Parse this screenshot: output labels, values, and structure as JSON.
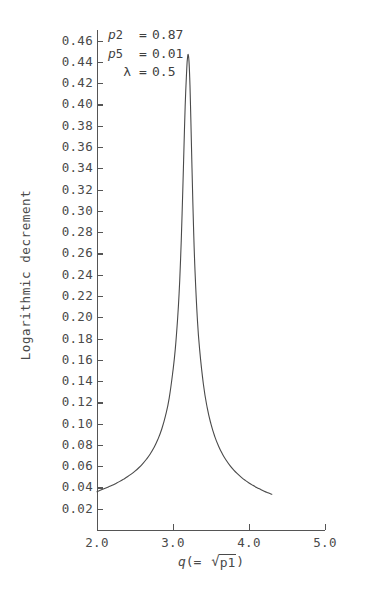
{
  "chart_data": {
    "type": "line",
    "title": "",
    "xlabel": "q(= √p1)",
    "ylabel": "Logarithmic decrement",
    "xlim": [
      2.0,
      5.0
    ],
    "ylim": [
      0.0,
      0.47
    ],
    "grid": false,
    "legend_position": "none",
    "x_ticks": [
      "2.0",
      "3.0",
      "4.0",
      "5.0"
    ],
    "x_tick_values": [
      2.0,
      3.0,
      4.0,
      5.0
    ],
    "y_ticks": [
      "0.02",
      "0.04",
      "0.06",
      "0.08",
      "0.10",
      "0.12",
      "0.14",
      "0.16",
      "0.18",
      "0.20",
      "0.22",
      "0.24",
      "0.26",
      "0.28",
      "0.30",
      "0.32",
      "0.34",
      "0.36",
      "0.38",
      "0.40",
      "0.42",
      "0.44",
      "0.46"
    ],
    "y_tick_values": [
      0.02,
      0.04,
      0.06,
      0.08,
      0.1,
      0.12,
      0.14,
      0.16,
      0.18,
      0.2,
      0.22,
      0.24,
      0.26,
      0.28,
      0.3,
      0.32,
      0.34,
      0.36,
      0.38,
      0.4,
      0.42,
      0.44,
      0.46
    ],
    "series": [
      {
        "name": "Logarithmic decrement vs q",
        "color": "#4a4a4a",
        "x": [
          2.0,
          2.05,
          2.1,
          2.15,
          2.2,
          2.25,
          2.3,
          2.35,
          2.4,
          2.45,
          2.5,
          2.55,
          2.6,
          2.65,
          2.7,
          2.75,
          2.8,
          2.85,
          2.9,
          2.95,
          3.0,
          3.03,
          3.06,
          3.08,
          3.1,
          3.12,
          3.14,
          3.16,
          3.18,
          3.19,
          3.2,
          3.21,
          3.22,
          3.23,
          3.25,
          3.27,
          3.29,
          3.32,
          3.35,
          3.4,
          3.45,
          3.5,
          3.55,
          3.6,
          3.65,
          3.7,
          3.75,
          3.8,
          3.85,
          3.9,
          3.95,
          4.0,
          4.05,
          4.1,
          4.15,
          4.2,
          4.25,
          4.3
        ],
        "y": [
          0.036,
          0.0375,
          0.039,
          0.0405,
          0.042,
          0.0438,
          0.0457,
          0.0478,
          0.05,
          0.0525,
          0.0553,
          0.0585,
          0.0622,
          0.0665,
          0.0715,
          0.0775,
          0.085,
          0.0945,
          0.107,
          0.124,
          0.15,
          0.17,
          0.198,
          0.222,
          0.255,
          0.298,
          0.348,
          0.398,
          0.432,
          0.443,
          0.447,
          0.441,
          0.425,
          0.4,
          0.34,
          0.285,
          0.243,
          0.199,
          0.17,
          0.137,
          0.115,
          0.0995,
          0.0878,
          0.0788,
          0.0715,
          0.0655,
          0.0605,
          0.0563,
          0.0527,
          0.0495,
          0.0467,
          0.0442,
          0.042,
          0.04,
          0.0382,
          0.0365,
          0.035,
          0.0336
        ]
      }
    ],
    "peak": {
      "x": 3.2,
      "y": 0.447
    },
    "annotations": [
      {
        "symbol": "p",
        "subscript": "2",
        "equals": "=",
        "value": "0.87"
      },
      {
        "symbol": "p",
        "subscript": "5",
        "equals": "=",
        "value": "0.01"
      },
      {
        "symbol": "λ",
        "subscript": "",
        "equals": "=",
        "value": "0.5"
      }
    ]
  },
  "axis": {
    "ylabel": "Logarithmic decrement",
    "xlabel_prefix": "q",
    "xlabel_open": "(=",
    "xlabel_radicand": "p1",
    "xlabel_close": ")"
  },
  "caption": {
    "partial_text": ""
  }
}
